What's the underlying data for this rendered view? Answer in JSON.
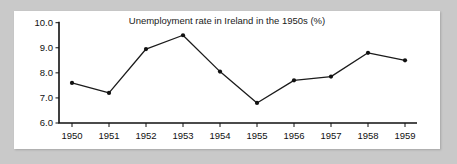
{
  "chart_data": {
    "type": "line",
    "title": "Unemployment rate in Ireland in the 1950s (%)",
    "xlabel": "",
    "ylabel": "",
    "categories": [
      "1950",
      "1951",
      "1952",
      "1953",
      "1954",
      "1955",
      "1956",
      "1957",
      "1958",
      "1959"
    ],
    "x": [
      1950,
      1951,
      1952,
      1953,
      1954,
      1955,
      1956,
      1957,
      1958,
      1959
    ],
    "values": [
      7.6,
      7.2,
      8.95,
      9.5,
      8.05,
      6.8,
      7.7,
      7.85,
      8.8,
      8.5
    ],
    "series": [
      {
        "name": "Unemployment rate",
        "values": [
          7.6,
          7.2,
          8.95,
          9.5,
          8.05,
          6.8,
          7.7,
          7.85,
          8.8,
          8.5
        ]
      }
    ],
    "ylim": [
      6.0,
      10.0
    ],
    "yticks": [
      6.0,
      7.0,
      8.0,
      9.0,
      10.0
    ],
    "ytick_labels": [
      "6.0",
      "7.0",
      "8.0",
      "9.0",
      "10.0"
    ],
    "xtick_labels": [
      "1950",
      "1951",
      "1952",
      "1953",
      "1954",
      "1955",
      "1956",
      "1957",
      "1958",
      "1959"
    ],
    "grid": false,
    "legend": false,
    "marker": "circle",
    "line_color": "#1b1b1b",
    "marker_color": "#111111",
    "axis_color": "#111111",
    "plot_background": "#ffffff",
    "page_background": "#c9c9c9"
  }
}
